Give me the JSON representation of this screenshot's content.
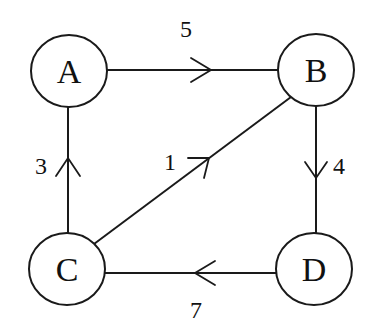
{
  "diagram": {
    "type": "directed-weighted-graph",
    "colors": {
      "stroke": "#1a1a1a",
      "text": "#111111",
      "background": "#ffffff"
    },
    "nodes": [
      {
        "id": "A",
        "label": "A",
        "cx": 69,
        "cy": 71,
        "rx": 38,
        "ry": 36
      },
      {
        "id": "B",
        "label": "B",
        "cx": 316,
        "cy": 70,
        "rx": 38,
        "ry": 36
      },
      {
        "id": "C",
        "label": "C",
        "cx": 67,
        "cy": 269,
        "rx": 38,
        "ry": 36
      },
      {
        "id": "D",
        "label": "D",
        "cx": 314,
        "cy": 269,
        "rx": 38,
        "ry": 36
      }
    ],
    "edges": [
      {
        "from": "A",
        "to": "B",
        "weight": "5"
      },
      {
        "from": "B",
        "to": "D",
        "weight": "4"
      },
      {
        "from": "D",
        "to": "C",
        "weight": "7"
      },
      {
        "from": "C",
        "to": "A",
        "weight": "3"
      },
      {
        "from": "C",
        "to": "B",
        "weight": "1"
      }
    ]
  }
}
